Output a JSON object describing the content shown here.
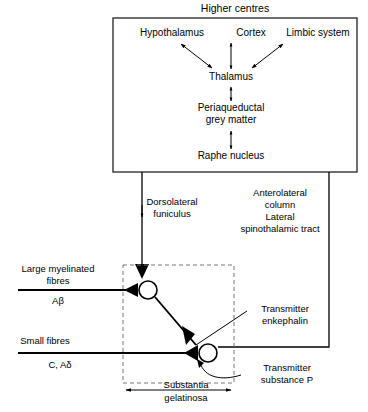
{
  "figure": {
    "title": "Higher centres",
    "higher_centres_box": {
      "nodes": [
        {
          "id": "hypothalamus",
          "label": "Hypothalamus"
        },
        {
          "id": "cortex",
          "label": "Cortex"
        },
        {
          "id": "limbic_system",
          "label": "Limbic system"
        },
        {
          "id": "thalamus",
          "label": "Thalamus"
        },
        {
          "id": "periaqueductal_grey_matter_line1",
          "label": "Periaqueductal"
        },
        {
          "id": "periaqueductal_grey_matter_line2",
          "label": "grey matter"
        },
        {
          "id": "raphe_nucleus",
          "label": "Raphe nucleus"
        }
      ]
    },
    "tract_labels": {
      "dorsolateral_funiculus_line1": "Dorsolateral",
      "dorsolateral_funiculus_line2": "funiculus",
      "anterolateral_line1": "Anterolateral",
      "anterolateral_line2": "column",
      "anterolateral_line3": "Lateral",
      "anterolateral_line4": "spinothalamic tract"
    },
    "fibre_labels": {
      "large_line1": "Large myelinated",
      "large_line2": "fibres",
      "large_type": "Aβ",
      "small_line1": "Small fibres",
      "small_type": "C, Aδ"
    },
    "transmitter_labels": {
      "enkephalin_line1": "Transmitter",
      "enkephalin_line2": "enkephalin",
      "substance_p_line1": "Transmitter",
      "substance_p_line2": "substance P"
    },
    "region_label": {
      "line1": "Substantia",
      "line2": "gelatinosa"
    },
    "colors": {
      "ink": "#000000",
      "box_stroke": "#222222",
      "dashed_stroke": "#777777",
      "background": "#ffffff"
    }
  }
}
